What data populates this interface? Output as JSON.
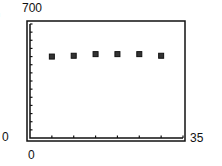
{
  "panel_label": ")",
  "chart_data": {
    "type": "scatter",
    "title": "",
    "xlabel": "",
    "ylabel": "",
    "xlim": [
      0,
      35
    ],
    "ylim": [
      0,
      700
    ],
    "x_tick_labels": [
      "0",
      "35"
    ],
    "y_tick_labels": [
      "0",
      "700"
    ],
    "x_ticks": [
      5,
      10,
      15,
      20,
      25,
      30,
      35
    ],
    "y_ticks": [
      50,
      100,
      150,
      200,
      250,
      300,
      350,
      400,
      450,
      500,
      550,
      600,
      650,
      700
    ],
    "grid": false,
    "legend": null,
    "marker": "square",
    "x": [
      5,
      10,
      15,
      20,
      25,
      30
    ],
    "y": [
      500,
      505,
      515,
      515,
      515,
      505
    ]
  }
}
